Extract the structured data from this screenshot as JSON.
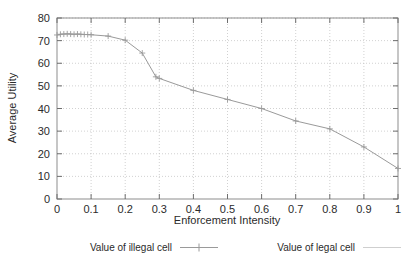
{
  "chart_data": {
    "type": "line",
    "title": "",
    "xlabel": "Enforcement Intensity",
    "ylabel": "Average Utility",
    "xlim": [
      0,
      1
    ],
    "ylim": [
      0,
      80
    ],
    "xticks": [
      "0",
      "0.1",
      "0.2",
      "0.3",
      "0.4",
      "0.5",
      "0.6",
      "0.7",
      "0.8",
      "0.9",
      "1"
    ],
    "xtick_values": [
      0,
      0.1,
      0.2,
      0.3,
      0.4,
      0.5,
      0.6,
      0.7,
      0.8,
      0.9,
      1
    ],
    "yticks": [
      "0",
      "10",
      "20",
      "30",
      "40",
      "50",
      "60",
      "70",
      "80"
    ],
    "ytick_values": [
      0,
      10,
      20,
      30,
      40,
      50,
      60,
      70,
      80
    ],
    "grid": true,
    "grid_style": "dotted",
    "legend_position": "bottom",
    "series": [
      {
        "name": "Value of illegal cell",
        "marker": "plus",
        "color": "#9a9a9a",
        "x": [
          0.0,
          0.01,
          0.02,
          0.03,
          0.04,
          0.05,
          0.06,
          0.07,
          0.08,
          0.09,
          0.1,
          0.15,
          0.2,
          0.25,
          0.29,
          0.3,
          0.4,
          0.5,
          0.6,
          0.7,
          0.8,
          0.9,
          1.0
        ],
        "y": [
          72.5,
          72.8,
          72.9,
          73.0,
          72.9,
          72.8,
          72.9,
          72.8,
          72.7,
          72.7,
          72.6,
          72.0,
          70.2,
          64.5,
          54.0,
          53.3,
          48.0,
          44.0,
          40.0,
          34.5,
          31.0,
          23.0,
          13.5
        ]
      },
      {
        "name": "Value of legal cell",
        "marker": "none",
        "color": "#cfcfcf",
        "x": [],
        "y": []
      }
    ]
  },
  "legend": {
    "entries": [
      {
        "label": "Value of illegal cell"
      },
      {
        "label": "Value of legal cell"
      }
    ]
  }
}
